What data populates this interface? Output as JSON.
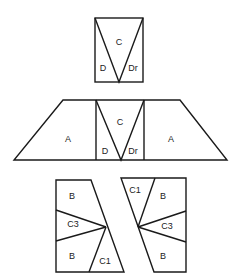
{
  "figure": {
    "top": {
      "labels": {
        "c": "C",
        "d": "D",
        "dr": "Dr"
      }
    },
    "middle": {
      "labels": {
        "a_left": "A",
        "c": "C",
        "d": "D",
        "dr": "Dr",
        "a_right": "A"
      }
    },
    "bottom_left": {
      "labels": {
        "b_top": "B",
        "c3": "C3",
        "b_bottom": "B",
        "c1": "C1"
      }
    },
    "bottom_right": {
      "labels": {
        "c1": "C1",
        "b_top": "B",
        "c3": "C3",
        "b_bottom": "B"
      }
    },
    "colors": {
      "stroke": "#1a1a1a",
      "background": "#ffffff",
      "text": "#222222"
    }
  }
}
